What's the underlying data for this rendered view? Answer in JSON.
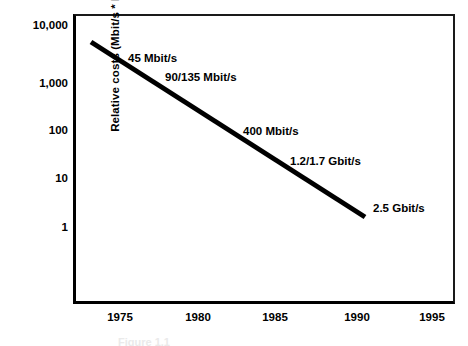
{
  "chart_data": {
    "type": "line",
    "title": "",
    "subtitle": "",
    "xlabel": "",
    "ylabel": "Relative costs  (Mbit/s * km)",
    "xlim": [
      1973,
      1996
    ],
    "ylim": [
      1,
      10000
    ],
    "yscale": "log",
    "grid": false,
    "legend": "none",
    "x_ticks": [
      {
        "value": 1975,
        "label": "1975",
        "px": 120
      },
      {
        "value": 1980,
        "label": "1980",
        "px": 198
      },
      {
        "value": 1985,
        "label": "1985",
        "px": 275
      },
      {
        "value": 1990,
        "label": "1990",
        "px": 357
      },
      {
        "value": 1995,
        "label": "1995",
        "px": 432
      }
    ],
    "y_ticks": [
      {
        "value": 10000,
        "label": "10,000",
        "px": 25
      },
      {
        "value": 1000,
        "label": "1,000",
        "px": 83
      },
      {
        "value": 100,
        "label": "100",
        "px": 130
      },
      {
        "value": 10,
        "label": "10",
        "px": 178
      },
      {
        "value": 1,
        "label": "1",
        "px": 227
      }
    ],
    "series": [
      {
        "name": "Relative transmission cost",
        "x": [
          1973.3,
          1990.5
        ],
        "y": [
          5000,
          4.5
        ],
        "line_width": 5,
        "color": "#000000",
        "points_px": [
          [
            91,
            42
          ],
          [
            365,
            217
          ]
        ]
      }
    ],
    "annotations": [
      {
        "text": "45 Mbit/s",
        "x_px": 128,
        "y_px": 64,
        "year": 1976,
        "cost": 2000
      },
      {
        "text": "90/135 Mbit/s",
        "x_px": 165,
        "y_px": 83,
        "year": 1979,
        "cost": 900
      },
      {
        "text": "400 Mbit/s",
        "x_px": 243,
        "y_px": 137,
        "year": 1984,
        "cost": 130
      },
      {
        "text": "1.2/1.7 Gbit/s",
        "x_px": 290,
        "y_px": 167,
        "year": 1987,
        "cost": 35
      },
      {
        "text": "2.5 Gbit/s",
        "x_px": 373,
        "y_px": 214,
        "year": 1991,
        "cost": 5
      }
    ]
  },
  "caption": {
    "text": "Figure 1.1"
  },
  "colors": {
    "axis": "#000000",
    "line": "#000000",
    "text": "#000000",
    "background": "#ffffff"
  }
}
